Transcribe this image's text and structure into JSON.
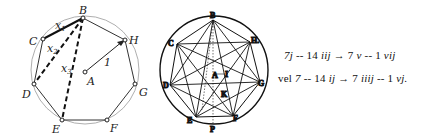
{
  "left_diagram": {
    "vertices": [
      {
        "label": "B",
        "x": 83,
        "y": 18
      },
      {
        "label": "H",
        "x": 125,
        "y": 40
      },
      {
        "label": "G",
        "x": 135,
        "y": 84
      },
      {
        "label": "F",
        "x": 107,
        "y": 120
      },
      {
        "label": "E",
        "x": 62,
        "y": 120
      },
      {
        "label": "D",
        "x": 34,
        "y": 84
      },
      {
        "label": "C",
        "x": 43,
        "y": 39
      }
    ],
    "center": {
      "label": "A",
      "x": 85,
      "y": 72
    },
    "radius_label": "1",
    "chord_labels": [
      "x",
      "x",
      "x"
    ],
    "chord_subscripts": [
      "1",
      "2",
      "3"
    ]
  },
  "right_diagram": {
    "labels": {
      "B": "B",
      "H": "H.",
      "G": "G",
      "F": "F",
      "E": "E",
      "D": "D",
      "C": "C",
      "A": "A",
      "I": "I",
      "K": "K",
      "P": "P"
    }
  },
  "formulas": {
    "line1": {
      "a": "7",
      "b": "j",
      "c": " -- 14 ",
      "d": "iij",
      "e": " → 7 ",
      "f": "v",
      "g": " -- 1 ",
      "h": "vij"
    },
    "line2": {
      "prefix": "vel ",
      "a": "7",
      "c": " -- 14 ",
      "d": "ij",
      "e": " → 7 ",
      "f": "iiij",
      "g": " -- 1 ",
      "h": "vj."
    }
  }
}
